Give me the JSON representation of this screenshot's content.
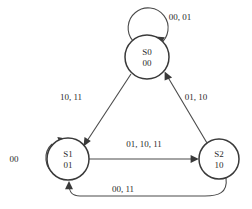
{
  "diagram": {
    "type": "finite-state-machine",
    "title": "",
    "states": [
      {
        "id": "S0",
        "name": "S0",
        "encoding": "00",
        "cx": 147,
        "cy": 57,
        "r": 22
      },
      {
        "id": "S1",
        "name": "S1",
        "encoding": "01",
        "cx": 68,
        "cy": 159,
        "r": 21
      },
      {
        "id": "S2",
        "name": "S2",
        "encoding": "10",
        "cx": 219,
        "cy": 159,
        "r": 20
      }
    ],
    "transitions": [
      {
        "id": "t0",
        "from": "S0",
        "to": "S0",
        "label": "00, 01",
        "kind": "self-loop",
        "label_x": 180,
        "label_y": 20
      },
      {
        "id": "t1",
        "from": "S0",
        "to": "S1",
        "label": "10, 11",
        "kind": "edge",
        "label_x": 71,
        "label_y": 100
      },
      {
        "id": "t2",
        "from": "S2",
        "to": "S0",
        "label": "01, 10",
        "kind": "edge",
        "label_x": 196,
        "label_y": 100
      },
      {
        "id": "t3",
        "from": "S1",
        "to": "S2",
        "label": "01, 10, 11",
        "kind": "edge",
        "label_x": 144,
        "label_y": 147
      },
      {
        "id": "t4",
        "from": "S1",
        "to": "S1",
        "label": "00",
        "kind": "self-loop",
        "label_x": 14,
        "label_y": 162
      },
      {
        "id": "t5",
        "from": "S2",
        "to": "S1",
        "label": "00, 11",
        "kind": "edge",
        "label_x": 123,
        "label_y": 192
      }
    ],
    "colors": {
      "background": "#ffffff",
      "node_stroke": "#3a3a3a",
      "edge_stroke": "#4a4a4a",
      "text": "#2b2b2b"
    }
  }
}
